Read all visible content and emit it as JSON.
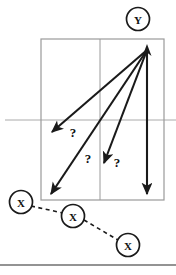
{
  "figure": {
    "type": "diagram",
    "background_color": "#ffffff",
    "stroke_color": "#1a1a1a",
    "grid_color": "#9a9a9a",
    "divider_color": "#aaaaaa",
    "width": 176,
    "height": 275
  },
  "nodes": {
    "target": {
      "label": "Y",
      "cx": 138,
      "cy": 19,
      "r": 11.5,
      "stroke": "#1a1a1a"
    },
    "sources": [
      {
        "label": "X",
        "cx": 21,
        "cy": 202,
        "r": 11.5
      },
      {
        "label": "X",
        "cx": 73,
        "cy": 216,
        "r": 11.5
      },
      {
        "label": "X",
        "cx": 128,
        "cy": 245,
        "r": 11.5
      }
    ]
  },
  "grid_box": {
    "x": 41,
    "y": 39,
    "width": 123,
    "height": 161,
    "vertical_divider_x": 100,
    "horizontal_line_y": 120,
    "horizontal_line_x1": 5,
    "horizontal_line_x2": 176
  },
  "arrows": {
    "origin": {
      "x": 147,
      "y": 50
    },
    "tips": [
      {
        "x": 52,
        "y": 132
      },
      {
        "x": 51,
        "y": 194
      },
      {
        "x": 104,
        "y": 163
      },
      {
        "x": 147,
        "y": 194
      }
    ]
  },
  "question_marks": [
    {
      "text": "?",
      "x": 73,
      "y": 132
    },
    {
      "text": "?",
      "x": 88,
      "y": 158
    },
    {
      "text": "?",
      "x": 117,
      "y": 162
    }
  ],
  "dashed_links": [
    {
      "x1": 31,
      "y1": 206,
      "x2": 63,
      "y2": 213
    },
    {
      "x1": 84,
      "y1": 220,
      "x2": 118,
      "y2": 240
    }
  ],
  "footer_rule": {
    "x1": 0,
    "y1": 265,
    "x2": 176,
    "y2": 265,
    "color": "#6f6f6f"
  }
}
